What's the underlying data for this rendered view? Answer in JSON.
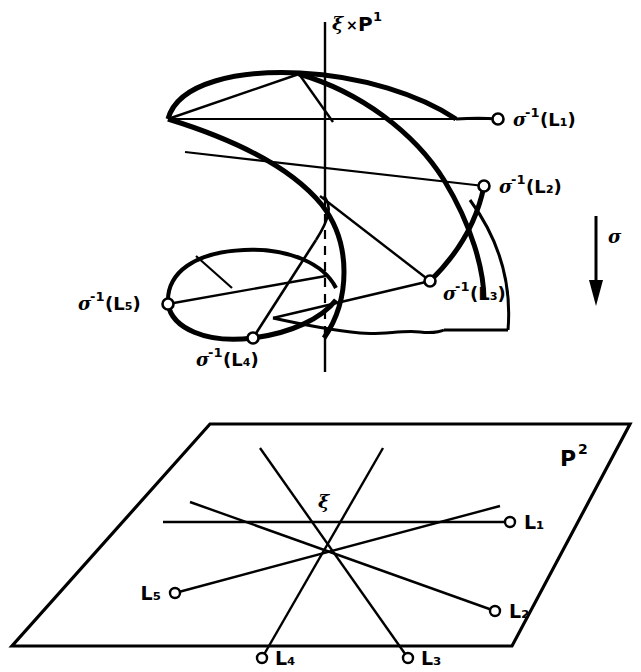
{
  "figure": {
    "upper": {
      "axis_label": "ξ × P¹",
      "axis_label_sym": "ξ",
      "axis_label_times": "×",
      "axis_label_p": "P",
      "axis_label_exp": "1",
      "points": [
        {
          "id": "p1",
          "label": "σ⁻¹(L₁)",
          "sigma": "σ",
          "exp": "-1",
          "arg": "(L₁)",
          "x": 498,
          "y": 119,
          "label_x": 513,
          "label_y": 126,
          "anchor": "start"
        },
        {
          "id": "p2",
          "label": "σ⁻¹(L₂)",
          "sigma": "σ",
          "exp": "-1",
          "arg": "(L₂)",
          "x": 484,
          "y": 186,
          "label_x": 499,
          "label_y": 193,
          "anchor": "start"
        },
        {
          "id": "p3",
          "label": "σ⁻¹(L₃)",
          "sigma": "σ",
          "exp": "-1",
          "arg": "(L₃)",
          "x": 430,
          "y": 281,
          "label_x": 443,
          "label_y": 300,
          "anchor": "start"
        },
        {
          "id": "p4",
          "label": "σ⁻¹(L₄)",
          "sigma": "σ",
          "exp": "-1",
          "arg": "(L₄)",
          "x": 253,
          "y": 338,
          "label_x": 253,
          "label_y": 366,
          "anchor": "middle"
        },
        {
          "id": "p5",
          "label": "σ⁻¹(L₅)",
          "sigma": "σ",
          "exp": "-1",
          "arg": "(L₅)",
          "x": 168,
          "y": 304,
          "label_x": 160,
          "label_y": 310,
          "anchor": "end"
        }
      ]
    },
    "map": {
      "arrow_label": "σ",
      "direction": "down",
      "arrow_x": 596,
      "arrow_y_top": 216,
      "arrow_y_bottom": 300,
      "label_x": 608,
      "label_y": 243
    },
    "lower": {
      "plane_label": "P²",
      "plane_label_p": "P",
      "plane_label_exp": "2",
      "plane_label_x": 567,
      "plane_label_y": 460,
      "center_label": "ξ",
      "center_x": 325,
      "center_y": 522,
      "center_label_x": 322,
      "center_label_y": 507,
      "lines": [
        {
          "id": "L1",
          "label": "L₁",
          "end_x": 510,
          "end_y": 522,
          "far_x": 163,
          "far_y": 522,
          "label_x": 524,
          "label_y": 528,
          "anchor": "start"
        },
        {
          "id": "L2",
          "label": "L₂",
          "end_x": 495,
          "end_y": 611,
          "far_x": 190,
          "far_y": 502,
          "label_x": 509,
          "label_y": 617,
          "anchor": "start"
        },
        {
          "id": "L3",
          "label": "L₃",
          "end_x": 408,
          "end_y": 658,
          "far_x": 260,
          "far_y": 448,
          "label_x": 421,
          "label_y": 664,
          "anchor": "start"
        },
        {
          "id": "L4",
          "label": "L₄",
          "end_x": 262,
          "end_y": 658,
          "far_x": 383,
          "far_y": 448,
          "label_x": 275,
          "label_y": 664,
          "anchor": "start"
        },
        {
          "id": "L5",
          "label": "L₅",
          "end_x": 175,
          "end_y": 593,
          "far_x": 500,
          "far_y": 506,
          "label_x": 161,
          "label_y": 599,
          "anchor": "end"
        }
      ],
      "plane_corners": "210,424 630,424 512,646 12,646"
    },
    "colors": {
      "ink": "#000000",
      "background": "#ffffff"
    }
  }
}
